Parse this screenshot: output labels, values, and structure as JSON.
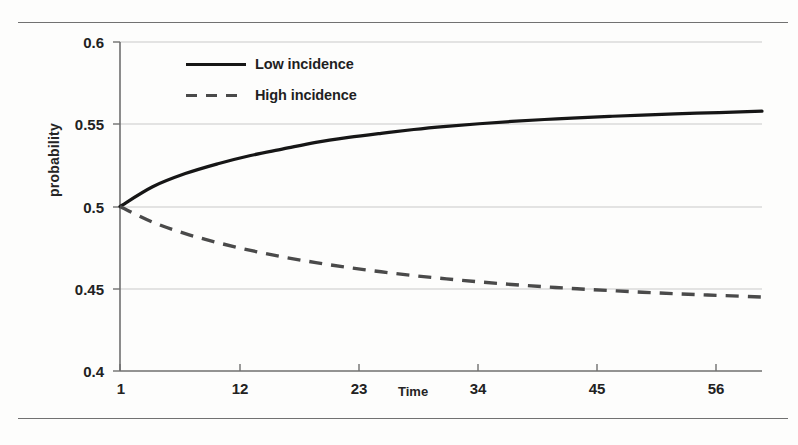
{
  "chart_data": {
    "type": "line",
    "title": "",
    "subtitle": "",
    "xlabel": "Time",
    "ylabel": "probability",
    "xlim": [
      1,
      60
    ],
    "ylim": [
      0.4,
      0.6
    ],
    "xticks": [
      "1",
      "12",
      "23",
      "34",
      "45",
      "56"
    ],
    "xtick_values": [
      1,
      12,
      23,
      34,
      45,
      56
    ],
    "yticks": [
      "0.4",
      "0.45",
      "0.5",
      "0.55",
      "0.6"
    ],
    "ytick_values": [
      0.4,
      0.45,
      0.5,
      0.55,
      0.6
    ],
    "grid": "horizontal",
    "legend_position": "top-center",
    "x": [
      1,
      4,
      7,
      10,
      13,
      16,
      19,
      22,
      25,
      28,
      31,
      34,
      37,
      40,
      43,
      46,
      49,
      52,
      55,
      58,
      60
    ],
    "series": [
      {
        "name": "Low incidence",
        "style": "solid",
        "color": "#161616",
        "values": [
          0.5,
          0.512,
          0.52,
          0.526,
          0.531,
          0.535,
          0.539,
          0.542,
          0.5445,
          0.5468,
          0.5487,
          0.5503,
          0.5517,
          0.5529,
          0.5539,
          0.5548,
          0.5556,
          0.5563,
          0.5569,
          0.5575,
          0.558
        ]
      },
      {
        "name": "High incidence",
        "style": "dashed",
        "color": "#4a4a4a",
        "values": [
          0.5,
          0.4905,
          0.4835,
          0.478,
          0.4733,
          0.4693,
          0.4659,
          0.4629,
          0.4603,
          0.458,
          0.456,
          0.4542,
          0.4526,
          0.4512,
          0.45,
          0.4489,
          0.4479,
          0.447,
          0.4462,
          0.4455,
          0.445
        ]
      }
    ]
  },
  "legend": {
    "items": [
      {
        "label": "Low incidence",
        "style": "solid"
      },
      {
        "label": "High incidence",
        "style": "dashed"
      }
    ]
  }
}
